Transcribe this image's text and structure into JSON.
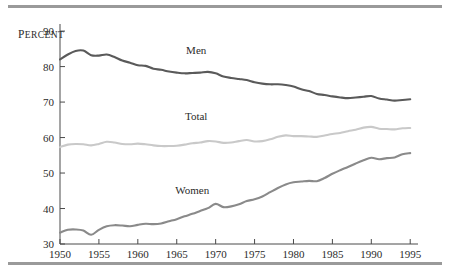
{
  "figure": {
    "background_color": "#ffffff",
    "rule_color": "#9a9a9a"
  },
  "chart_data": {
    "type": "line",
    "title": "",
    "subtitle": "",
    "xlabel": "",
    "ylabel": "Percent",
    "ylabel_display": "PERCENT",
    "xlim": [
      1950,
      1996
    ],
    "ylim": [
      30,
      92
    ],
    "yticks": [
      30,
      40,
      50,
      60,
      70,
      80,
      90
    ],
    "ytick_labels": [
      "30",
      "40",
      "50",
      "60",
      "70",
      "80",
      "90"
    ],
    "xticks": [
      1950,
      1955,
      1960,
      1965,
      1970,
      1975,
      1980,
      1985,
      1990,
      1995
    ],
    "xtick_labels": [
      "1950",
      "1955",
      "1960",
      "1965",
      "1970",
      "1975",
      "1980",
      "1985",
      "1990",
      "1995"
    ],
    "grid": false,
    "legend_position": "inline-labels",
    "x": [
      1950,
      1951,
      1952,
      1953,
      1954,
      1955,
      1956,
      1957,
      1958,
      1959,
      1960,
      1961,
      1962,
      1963,
      1964,
      1965,
      1966,
      1967,
      1968,
      1969,
      1970,
      1971,
      1972,
      1973,
      1974,
      1975,
      1976,
      1977,
      1978,
      1979,
      1980,
      1981,
      1982,
      1983,
      1984,
      1985,
      1986,
      1987,
      1988,
      1989,
      1990,
      1991,
      1992,
      1993,
      1994,
      1995
    ],
    "series": [
      {
        "name": "Men",
        "color": "#5a5a5a",
        "label_x": 1967.5,
        "label_y": 83.5,
        "values": [
          82.0,
          83.4,
          84.4,
          84.5,
          83.2,
          83.1,
          83.4,
          82.7,
          81.7,
          81.1,
          80.4,
          80.2,
          79.4,
          79.1,
          78.6,
          78.3,
          78.1,
          78.2,
          78.3,
          78.5,
          78.1,
          77.2,
          76.8,
          76.5,
          76.2,
          75.6,
          75.2,
          75.0,
          75.0,
          74.8,
          74.4,
          73.6,
          73.1,
          72.3,
          72.0,
          71.6,
          71.3,
          71.1,
          71.3,
          71.5,
          71.7,
          71.0,
          70.7,
          70.4,
          70.6,
          70.8
        ]
      },
      {
        "name": "Total",
        "color": "#c9c9c9",
        "label_x": 1967.5,
        "label_y": 65.0,
        "values": [
          57.3,
          58.0,
          58.2,
          58.1,
          57.8,
          58.2,
          58.8,
          58.6,
          58.2,
          58.1,
          58.3,
          58.1,
          57.8,
          57.6,
          57.6,
          57.7,
          58.0,
          58.4,
          58.6,
          59.0,
          58.9,
          58.5,
          58.6,
          59.0,
          59.3,
          58.9,
          59.0,
          59.5,
          60.2,
          60.6,
          60.4,
          60.4,
          60.3,
          60.2,
          60.6,
          61.0,
          61.3,
          61.8,
          62.2,
          62.8,
          63.0,
          62.5,
          62.4,
          62.3,
          62.6,
          62.7
        ]
      },
      {
        "name": "Women",
        "color": "#8a8a8a",
        "label_x": 1967.0,
        "label_y": 44.0,
        "values": [
          33.2,
          34.0,
          34.1,
          33.8,
          32.6,
          34.0,
          35.0,
          35.3,
          35.2,
          35.0,
          35.4,
          35.7,
          35.6,
          35.8,
          36.4,
          37.0,
          37.8,
          38.5,
          39.3,
          40.1,
          41.3,
          40.4,
          40.6,
          41.2,
          42.1,
          42.6,
          43.4,
          44.6,
          45.8,
          46.8,
          47.4,
          47.6,
          47.8,
          47.7,
          48.6,
          49.8,
          50.8,
          51.7,
          52.7,
          53.6,
          54.3,
          53.9,
          54.2,
          54.4,
          55.3,
          55.6
        ]
      }
    ]
  }
}
